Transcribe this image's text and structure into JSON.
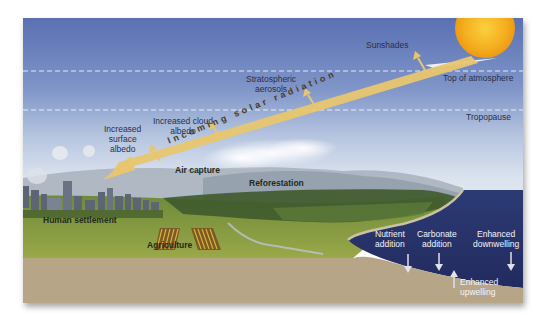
{
  "diagram": {
    "layers": {
      "top_of_atmosphere": "Top of atmosphere",
      "tropopause": "Tropopause"
    },
    "beam_label": "Incoming solar radiation",
    "labels": {
      "sunshades": "Sunshades",
      "stratospheric_aerosols_line1": "Stratospheric",
      "stratospheric_aerosols_line2": "aerosols",
      "cloud_albedo_line1": "Increased cloud",
      "cloud_albedo_line2": "albedo",
      "surface_albedo_line1": "Increased",
      "surface_albedo_line2": "surface",
      "surface_albedo_line3": "albedo",
      "air_capture": "Air capture",
      "reforestation": "Reforestation",
      "human_settlement": "Human settlement",
      "agriculture": "Agriculture",
      "nutrient_line1": "Nutrient",
      "nutrient_line2": "addition",
      "carbonate_line1": "Carbonate",
      "carbonate_line2": "addition",
      "downwelling_line1": "Enhanced",
      "downwelling_line2": "downwelling",
      "upwelling_line1": "Enhanced",
      "upwelling_line2": "upwelling"
    },
    "colors": {
      "sky_top": "#5d74b4",
      "sky_bottom": "#dfe7f0",
      "sun": "#f5b020",
      "beam": "#e8c878",
      "ocean": "#27336b",
      "soil": "#b5a485",
      "grass": "#8ea04a",
      "text_dark": "#2a2f48",
      "text_white": "#f2f4fa"
    }
  }
}
